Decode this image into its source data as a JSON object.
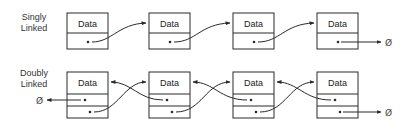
{
  "diagram": {
    "colors": {
      "stroke": "#2a2a2a",
      "text": "#222222",
      "background": "#ffffff"
    },
    "singly": {
      "label_line1": "Singly",
      "label_line2": "Linked",
      "nodes": [
        {
          "data": "Data"
        },
        {
          "data": "Data"
        },
        {
          "data": "Data"
        },
        {
          "data": "Data"
        }
      ],
      "null_symbol": "Ø"
    },
    "doubly": {
      "label_line1": "Doubly",
      "label_line2": "Linked",
      "nodes": [
        {
          "data": "Data"
        },
        {
          "data": "Data"
        },
        {
          "data": "Data"
        },
        {
          "data": "Data"
        }
      ],
      "null_left_symbol": "Ø",
      "null_right_symbol": "Ø"
    }
  }
}
